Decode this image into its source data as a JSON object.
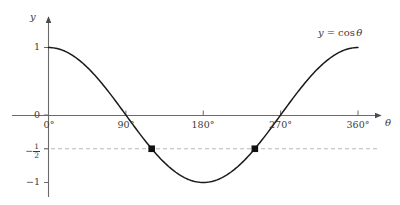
{
  "chart_data": {
    "type": "line",
    "title": "",
    "subtitle": "",
    "xlabel": "θ",
    "ylabel": "y",
    "curve_label": "y = cos θ",
    "curve_label_parts": {
      "y": "y",
      "equals": "=",
      "cos": "cos",
      "theta": "θ"
    },
    "xlim": [
      0,
      360
    ],
    "ylim": [
      -1,
      1
    ],
    "grid": false,
    "legend": "none",
    "x_ticks": [
      {
        "value": 0,
        "label": "0°"
      },
      {
        "value": 90,
        "label": "90°"
      },
      {
        "value": 180,
        "label": "180°"
      },
      {
        "value": 270,
        "label": "270°"
      },
      {
        "value": 360,
        "label": "360°"
      }
    ],
    "y_ticks": [
      {
        "value": 1,
        "label": "1"
      },
      {
        "value": 0,
        "label": "0"
      },
      {
        "value": -0.5,
        "label": "−½",
        "numerator": "1",
        "denominator": "2",
        "sign": "−"
      },
      {
        "value": -1,
        "label": "−1"
      }
    ],
    "series": [
      {
        "name": "y = cos θ",
        "color": "#1a1a1a",
        "x": [
          0,
          10,
          20,
          30,
          40,
          50,
          60,
          70,
          80,
          90,
          100,
          110,
          120,
          130,
          140,
          150,
          160,
          170,
          180,
          190,
          200,
          210,
          220,
          230,
          240,
          250,
          260,
          270,
          280,
          290,
          300,
          310,
          320,
          330,
          340,
          350,
          360
        ],
        "y": [
          1,
          0.985,
          0.94,
          0.866,
          0.766,
          0.643,
          0.5,
          0.342,
          0.174,
          0,
          -0.174,
          -0.342,
          -0.5,
          -0.643,
          -0.766,
          -0.866,
          -0.94,
          -0.985,
          -1,
          -0.985,
          -0.94,
          -0.866,
          -0.766,
          -0.643,
          -0.5,
          -0.342,
          -0.174,
          0,
          0.174,
          0.342,
          0.5,
          0.643,
          0.766,
          0.866,
          0.94,
          0.985,
          1
        ]
      }
    ],
    "reference_lines": [
      {
        "name": "y-half-dashed",
        "axis": "y",
        "value": -0.5,
        "style": "dashed",
        "color": "#b9b9b9"
      }
    ],
    "marked_points": [
      {
        "x": 120,
        "y": -0.5,
        "marker": "square",
        "color": "#111111"
      },
      {
        "x": 240,
        "y": -0.5,
        "marker": "square",
        "color": "#111111"
      }
    ],
    "axis_color": "#5b5b5b",
    "text_color": "#3a3a3a"
  }
}
